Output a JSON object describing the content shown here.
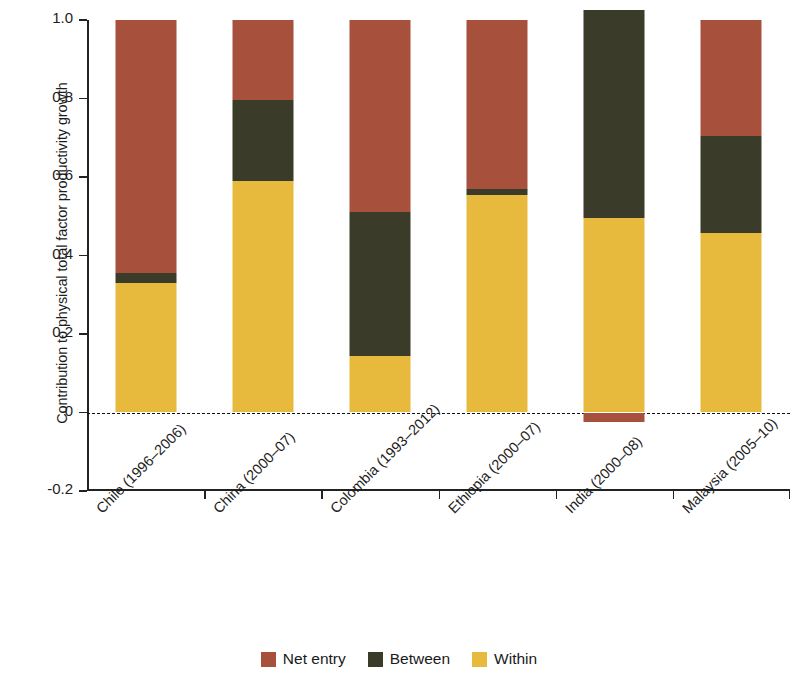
{
  "chart_data": {
    "type": "bar",
    "subtype": "stacked-bar",
    "title": "",
    "xlabel": "",
    "ylabel": "Contribution to physical total factor productivity growth",
    "ylim": [
      -0.2,
      1.0
    ],
    "yticks": [
      1.0,
      0.8,
      0.6,
      0.4,
      0.2,
      0,
      -0.2
    ],
    "ytick_labels": [
      "1.0",
      "0.8",
      "0.6",
      "0.4",
      "0.2",
      "0",
      "-0.2"
    ],
    "grid": false,
    "zero_reference_line": true,
    "legend_position": "bottom",
    "categories": [
      "Chile (1996–2006)",
      "China (2000–07)",
      "Colombia (1993–2012)",
      "Ethiopia (2000–07)",
      "India (2000–08)",
      "Malaysia (2005–10)"
    ],
    "series": [
      {
        "name": "Within",
        "color": "#e7b93c",
        "values": [
          0.33,
          0.59,
          0.145,
          0.553,
          0.495,
          0.457
        ]
      },
      {
        "name": "Between",
        "color": "#3b3b29",
        "values": [
          0.026,
          0.207,
          0.365,
          0.016,
          0.53,
          0.247
        ]
      },
      {
        "name": "Net entry",
        "color": "#a7503c",
        "values": [
          0.644,
          0.203,
          0.49,
          0.431,
          -0.025,
          0.296
        ]
      }
    ]
  },
  "axis": {
    "y_title": "Contribution to physical total factor productivity growth",
    "y_tick_labels": [
      "1.0",
      "0.8",
      "0.6",
      "0.4",
      "0.2",
      "0",
      "-0.2"
    ]
  },
  "legend": {
    "items": [
      {
        "label": "Net entry",
        "color": "#a7503c"
      },
      {
        "label": "Between",
        "color": "#3b3b29"
      },
      {
        "label": "Within",
        "color": "#e7b93c"
      }
    ]
  }
}
